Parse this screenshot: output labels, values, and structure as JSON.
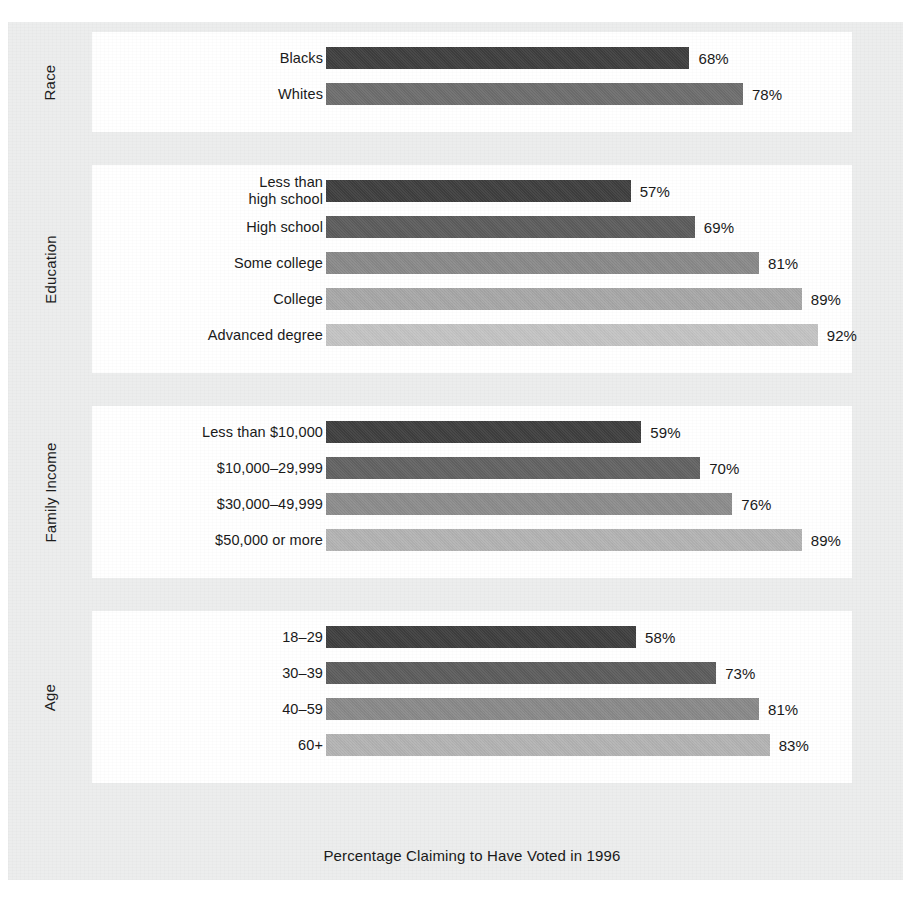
{
  "figure": {
    "caption": "Percentage Claiming to Have Voted in 1996",
    "background_color": "#eceded",
    "panel_color": "#ffffff",
    "text_color": "#1a1a1a"
  },
  "chart_data": {
    "type": "bar",
    "orientation": "horizontal",
    "title": "",
    "xlabel": "Percentage Claiming to Have Voted in 1996",
    "ylabel": "",
    "xlim": [
      0,
      100
    ],
    "grid": false,
    "legend": "none",
    "value_suffix": "%",
    "groups": [
      {
        "name": "Race",
        "categories": [
          "Blacks",
          "Whites"
        ],
        "values": [
          68,
          78
        ],
        "value_labels": [
          "68%",
          "78%"
        ],
        "colors": [
          "#3f3f3f",
          "#6e6e6e"
        ]
      },
      {
        "name": "Education",
        "categories": [
          "Less than\nhigh school",
          "High school",
          "Some college",
          "College",
          "Advanced degree"
        ],
        "values": [
          57,
          69,
          81,
          89,
          92
        ],
        "value_labels": [
          "57%",
          "69%",
          "81%",
          "89%",
          "92%"
        ],
        "colors": [
          "#3f3f3f",
          "#5d5d5d",
          "#8a8a8a",
          "#a8a8a8",
          "#c4c4c4"
        ]
      },
      {
        "name": "Family Income",
        "categories": [
          "Less than $10,000",
          "$10,000–29,999",
          "$30,000–49,999",
          "$50,000 or more"
        ],
        "values": [
          59,
          70,
          76,
          89
        ],
        "value_labels": [
          "59%",
          "70%",
          "76%",
          "89%"
        ],
        "colors": [
          "#3f3f3f",
          "#636363",
          "#8d8d8d",
          "#b4b4b4"
        ]
      },
      {
        "name": "Age",
        "categories": [
          "18–29",
          "30–39",
          "40–59",
          "60+"
        ],
        "values": [
          58,
          73,
          81,
          83
        ],
        "value_labels": [
          "58%",
          "73%",
          "81%",
          "83%"
        ],
        "colors": [
          "#3f3f3f",
          "#5d5d5d",
          "#8a8a8a",
          "#b4b4b4"
        ]
      }
    ]
  }
}
